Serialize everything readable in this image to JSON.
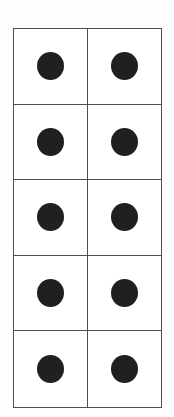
{
  "figure": {
    "rows": 5,
    "columns": 2,
    "total_dots": 10,
    "cells": [
      [
        true,
        true
      ],
      [
        true,
        true
      ],
      [
        true,
        true
      ],
      [
        true,
        true
      ],
      [
        true,
        true
      ]
    ]
  },
  "colors": {
    "background": "#fdfdfd",
    "cell_background": "#ffffff",
    "grid_line": "#4f4f4f",
    "dot": "#221f1f"
  }
}
